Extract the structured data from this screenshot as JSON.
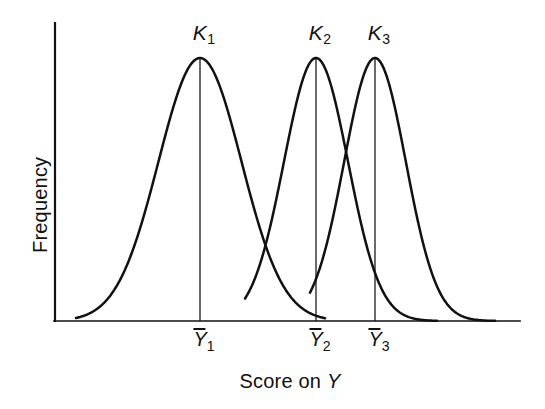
{
  "figure": {
    "background_color": "#ffffff",
    "line_color": "#111111",
    "axis_color": "#111111"
  },
  "axes": {
    "x_title_prefix": "Score on ",
    "x_title_variable": "Y",
    "y_title": "Frequency",
    "x_axis_label_full": "Score on Y"
  },
  "peak_labels": [
    {
      "symbol": "K",
      "subscript": "1"
    },
    {
      "symbol": "K",
      "subscript": "2"
    },
    {
      "symbol": "K",
      "subscript": "3"
    }
  ],
  "mean_labels": [
    {
      "symbol": "Y",
      "subscript": "1"
    },
    {
      "symbol": "Y",
      "subscript": "2"
    },
    {
      "symbol": "Y",
      "subscript": "3"
    }
  ],
  "chart_data": {
    "type": "line",
    "title": "",
    "xlabel": "Score on Y",
    "ylabel": "Frequency",
    "grid": false,
    "legend": "none",
    "xlim": [
      0,
      100
    ],
    "ylim": [
      0,
      1.1
    ],
    "axis_ticks": {
      "x": [],
      "y": []
    },
    "series": [
      {
        "name": "K1",
        "mean_label": "Y1",
        "mean_x": 26.0,
        "peak_y": 1.0,
        "sd": 8.9,
        "start_x": 4.0,
        "end_x": 58.0
      },
      {
        "name": "K2",
        "mean_label": "Y2",
        "mean_x": 51.0,
        "peak_y": 1.0,
        "sd": 6.9,
        "start_x": 41.0,
        "end_x": 82.0
      },
      {
        "name": "K3",
        "mean_label": "Y3",
        "mean_x": 64.0,
        "peak_y": 1.0,
        "sd": 6.6,
        "start_x": 55.0,
        "end_x": 95.0
      }
    ],
    "annotations": [
      {
        "text": "K1",
        "at_x": 26.0,
        "at_y": 1.07,
        "role": "peak-label"
      },
      {
        "text": "K2",
        "at_x": 51.0,
        "at_y": 1.07,
        "role": "peak-label"
      },
      {
        "text": "K3",
        "at_x": 64.0,
        "at_y": 1.07,
        "role": "peak-label"
      },
      {
        "text": "Y1",
        "at_x": 26.0,
        "at_y": -0.09,
        "role": "mean-tick-label"
      },
      {
        "text": "Y2",
        "at_x": 51.0,
        "at_y": -0.09,
        "role": "mean-tick-label"
      },
      {
        "text": "Y3",
        "at_x": 64.0,
        "at_y": -0.09,
        "role": "mean-tick-label"
      }
    ]
  },
  "geometry": {
    "plot": {
      "left": 54,
      "right": 520,
      "top": 23,
      "baseline": 321
    },
    "peaks_px": [
      {
        "x": 200,
        "y": 58
      },
      {
        "x": 316,
        "y": 58
      },
      {
        "x": 375,
        "y": 58
      }
    ],
    "curves_px": [
      {
        "start": 76,
        "end": 325,
        "mean": 200,
        "sd": 41.5
      },
      {
        "start": 245,
        "end": 437,
        "mean": 316,
        "sd": 32.0
      },
      {
        "start": 310,
        "end": 495,
        "mean": 375,
        "sd": 30.8
      }
    ],
    "peak_label_px": [
      {
        "x": 204,
        "y": 22
      },
      {
        "x": 320,
        "y": 22
      },
      {
        "x": 379,
        "y": 22
      }
    ],
    "mean_label_px": [
      {
        "x": 204,
        "y": 328
      },
      {
        "x": 320,
        "y": 328
      },
      {
        "x": 379,
        "y": 328
      }
    ],
    "x_title_px": {
      "x": 290,
      "y": 371
    },
    "y_title_px": {
      "x": 30,
      "y": 253
    }
  }
}
